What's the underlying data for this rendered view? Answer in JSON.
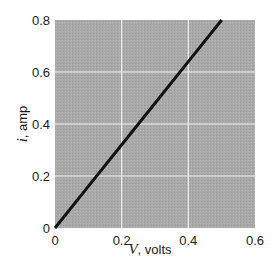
{
  "chart_data": {
    "type": "line",
    "title": "",
    "xlabel_var": "V",
    "xlabel_unit": ", volts",
    "ylabel_var": "i",
    "ylabel_unit": ", amp",
    "xlim": [
      0,
      0.6
    ],
    "ylim": [
      0,
      0.8
    ],
    "x_ticks": [
      "0",
      "0.2",
      "0.4",
      "0.6"
    ],
    "y_ticks": [
      "0",
      "0.2",
      "0.4",
      "0.6",
      "0.8"
    ],
    "grid": true,
    "legend": null,
    "series": [
      {
        "name": "i vs V",
        "x": [
          0,
          0.1,
          0.2,
          0.3,
          0.4,
          0.5
        ],
        "y": [
          0,
          0.16,
          0.32,
          0.48,
          0.64,
          0.8
        ]
      }
    ],
    "colors": {
      "plot_background": "#a9a9a9",
      "gridline": "#f2f2f2",
      "line": "#111111"
    }
  }
}
